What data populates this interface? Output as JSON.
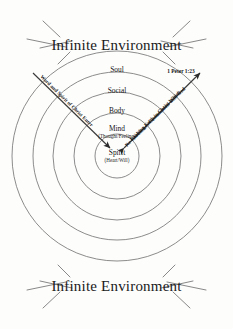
{
  "diagram": {
    "title_top": "Infinite Environment",
    "title_bottom": "Infinite Environment",
    "rings": [
      {
        "label": "Soul",
        "sublabel": ""
      },
      {
        "label": "Social",
        "sublabel": ""
      },
      {
        "label": "Body",
        "sublabel": ""
      },
      {
        "label": "Mind",
        "sublabel": "(Thought/Feeling)"
      },
      {
        "label": "Spirit",
        "sublabel": "(Heart/Will)"
      }
    ],
    "left_arrow_label": "Word and Spirit of Christ Enter",
    "right_arrow_label_line1": "Exalting Faith in Christ Which",
    "right_arrow_label_line2": "Re-establishes Communion with God",
    "scripture_reference": "1 Peter 1:23",
    "colors": {
      "background": "#fdfdfc",
      "ring_stroke": "#6e6e6e",
      "ray_stroke": "#6a6a6a",
      "axis_stroke": "#3a3a3a",
      "text": "#1a1a1a"
    }
  }
}
